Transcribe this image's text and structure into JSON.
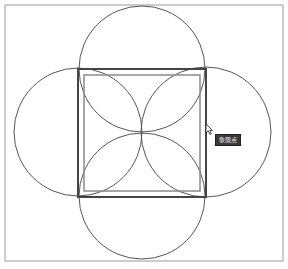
{
  "drawing": {
    "frame": {
      "x": 5,
      "y": 5,
      "width": 278,
      "height": 256,
      "stroke": "#9a9a9a"
    },
    "outer_square": {
      "x": 78,
      "y": 69,
      "size": 128,
      "stroke": "#444444",
      "stroke_width": 2
    },
    "inner_square": {
      "x": 84,
      "y": 75,
      "size": 116,
      "stroke": "#8a8a8a",
      "stroke_width": 1.5
    },
    "circles": [
      {
        "name": "top",
        "cx": 142,
        "cy": 69,
        "r": 63
      },
      {
        "name": "left",
        "cx": 78,
        "cy": 132,
        "r": 64
      },
      {
        "name": "right",
        "cx": 206,
        "cy": 132,
        "r": 65
      },
      {
        "name": "bottom",
        "cx": 142,
        "cy": 196,
        "r": 63
      }
    ],
    "circle_stroke": "#555555",
    "cursor": {
      "x": 206,
      "y": 124,
      "icon": "arrow-cursor-icon"
    },
    "snap_tooltip": {
      "label": "象限点",
      "x": 215,
      "y": 134,
      "background": "#3a3a3a"
    }
  }
}
